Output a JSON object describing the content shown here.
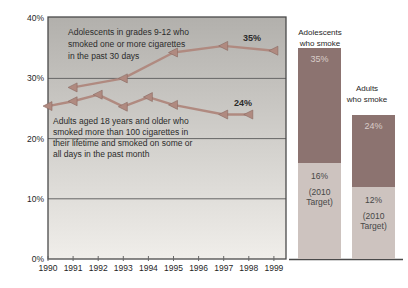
{
  "chart_data": {
    "type": "line",
    "title": "",
    "xlabel": "",
    "ylabel": "",
    "ylim": [
      0,
      40
    ],
    "y_ticks": [
      "0%",
      "10%",
      "20%",
      "30%",
      "40%"
    ],
    "y_tick_values": [
      0,
      10,
      20,
      30,
      40
    ],
    "x_ticks": [
      "1990",
      "1991",
      "1992",
      "1993",
      "1994",
      "1995",
      "1996",
      "1997",
      "1998",
      "1999"
    ],
    "gridlines_pct": [
      10,
      20,
      30
    ],
    "series": [
      {
        "id": "adolescents",
        "name": "Adolescents in grades 9-12 who smoked one or more cigarettes in the past 30 days",
        "note_lines": [
          "Adolescents in grades 9-12 who",
          "smoked one or more cigarettes",
          "in the past 30 days"
        ],
        "x": [
          1991,
          1993,
          1995,
          1997,
          1999
        ],
        "values": [
          28.5,
          30.0,
          34.3,
          35.4,
          34.6
        ],
        "end_label": "35%"
      },
      {
        "id": "adults",
        "name": "Adults aged 18 years and older who smoked more than 100 cigarettes in their lifetime and smoked on some or all days in the past month",
        "note_lines": [
          "Adults aged 18 years and older who",
          "smoked more than 100 cigarettes in",
          "their lifetime and smoked on some or",
          "all days in the past month"
        ],
        "x": [
          1990,
          1991,
          1992,
          1993,
          1994,
          1995,
          1997,
          1998
        ],
        "values": [
          25.4,
          26.2,
          27.3,
          25.3,
          26.9,
          25.6,
          24.0,
          24.0
        ],
        "end_label": "24%"
      }
    ],
    "bars": [
      {
        "id": "adolescents-bar",
        "caption_lines": [
          "Adolescents",
          "who smoke"
        ],
        "caption": "Adolescents who smoke",
        "value": 35,
        "value_label": "35%",
        "target": 16,
        "target_label": "16%",
        "target_note": "(2010 Target)"
      },
      {
        "id": "adults-bar",
        "caption_lines": [
          "Adults",
          "who smoke"
        ],
        "caption": "Adults who smoke",
        "value": 24,
        "value_label": "24%",
        "target": 12,
        "target_label": "12%",
        "target_note": "(2010 Target)"
      }
    ]
  },
  "colors": {
    "line": "#b08a80",
    "marker_edge": "#8a6a62",
    "bar_dark": "#8c7370",
    "bar_light": "#cdc3bf",
    "bar_value_text": "#d9cdc9",
    "plot_bg_top": "#b2b0ac",
    "plot_bg_bottom": "#f0eeea",
    "grid": "#666666",
    "border": "#4a4a4a"
  }
}
